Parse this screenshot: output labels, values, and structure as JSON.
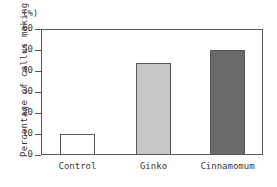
{
  "chart_data": {
    "type": "bar",
    "title": "",
    "xlabel": "",
    "ylabel": "Percentage of callus making",
    "unit_label": "(%)",
    "categories": [
      "Control",
      "Ginko",
      "Cinnamomum"
    ],
    "values": [
      10,
      44,
      50
    ],
    "series": [
      {
        "name": "Percentage of callus making",
        "values": [
          10,
          44,
          50
        ]
      }
    ],
    "ylim": [
      0,
      60
    ],
    "yticks": [
      0,
      10,
      20,
      30,
      40,
      50,
      60
    ],
    "ytick_labels": [
      "0",
      "10",
      "20",
      "30",
      "40",
      "50",
      "60"
    ],
    "grid": false,
    "legend": false,
    "bar_colors": [
      "#ffffff",
      "#c8c8c8",
      "#6a6a6a"
    ],
    "bar_edge_color": "#58585a",
    "axis_color": "#58585a",
    "text_color": "#3a3a3a"
  }
}
